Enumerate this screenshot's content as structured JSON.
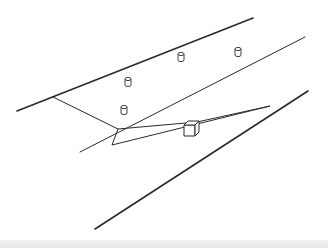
{
  "diagram": {
    "colors": {
      "background": "#ffffff",
      "stroke": "#2a2a2a",
      "bottom_band": "#e8e8e8"
    },
    "lines": [
      {
        "name": "top-boundary-line",
        "x1": 17,
        "y1": 111,
        "x2": 253,
        "y2": 18,
        "width": 1.6
      },
      {
        "name": "crossing-line",
        "x1": 53,
        "y1": 97,
        "x2": 118,
        "y2": 129,
        "width": 1.0
      },
      {
        "name": "middle-lane-line",
        "x1": 80,
        "y1": 152,
        "x2": 305,
        "y2": 37,
        "width": 1.0
      },
      {
        "name": "bottom-boundary-line",
        "x1": 95,
        "y1": 229,
        "x2": 308,
        "y2": 91,
        "width": 1.6
      }
    ],
    "wedge": {
      "name": "visibility-wedge",
      "points": "118,129 112,145 270,106 197,122"
    },
    "cylinders": [
      {
        "name": "cylinder-1",
        "cx": 181,
        "cy": 57
      },
      {
        "name": "cylinder-2",
        "cx": 238,
        "cy": 52
      },
      {
        "name": "cylinder-3",
        "cx": 128,
        "cy": 82
      },
      {
        "name": "cylinder-4",
        "cx": 124,
        "cy": 110
      }
    ],
    "cube": {
      "name": "cube-object",
      "x": 184,
      "y": 121,
      "size": 11
    }
  }
}
